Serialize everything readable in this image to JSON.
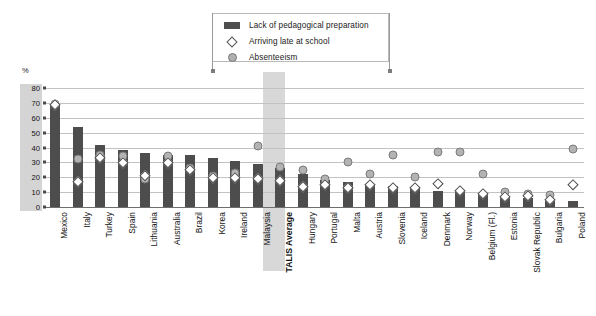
{
  "legend": {
    "items": [
      {
        "label": "Lack of pedagogical preparation",
        "mark": "bar-swatch",
        "color": "#4f4f4f"
      },
      {
        "label": "Arriving late at school",
        "mark": "diamond-marker",
        "color": "#ffffff"
      },
      {
        "label": "Absenteeism",
        "mark": "circle-marker",
        "color": "#b0b0b0"
      }
    ]
  },
  "axis": {
    "y_unit_label": "%",
    "y_ticks": [
      "0",
      "10",
      "20",
      "30",
      "40",
      "50",
      "60",
      "70",
      "80"
    ]
  },
  "chart_data": {
    "type": "bar",
    "title": "",
    "subtitle": "",
    "xlabel": "",
    "ylabel": "%",
    "ylim": [
      0,
      80
    ],
    "ytick_step": 10,
    "grid": true,
    "legend_position": "top-center",
    "highlighted_category": "TALIS Average",
    "categories": [
      "Mexico",
      "Italy",
      "Turkey",
      "Spain",
      "Lithuania",
      "Australia",
      "Brazil",
      "Korea",
      "Ireland",
      "Malaysia",
      "TALIS Average",
      "Hungary",
      "Portugal",
      "Malta",
      "Austria",
      "Slovenia",
      "Iceland",
      "Denmark",
      "Norway",
      "Belgium (Fl.)",
      "Estonia",
      "Slovak Republic",
      "Bulgaria",
      "Poland"
    ],
    "series": [
      {
        "name": "Lack of pedagogical preparation",
        "type": "bar",
        "color": "#4d4d4d",
        "values": [
          69,
          54,
          42,
          38,
          36,
          35,
          35,
          33,
          31,
          29,
          26,
          22,
          18,
          17,
          15,
          14,
          13,
          11,
          10,
          8,
          7,
          6,
          5,
          4
        ]
      },
      {
        "name": "Arriving late at school",
        "type": "diamond-marker",
        "color": "#ffffff",
        "values": [
          69,
          17,
          33,
          30,
          21,
          30,
          25,
          20,
          20,
          19,
          18,
          14,
          15,
          13,
          15,
          13,
          13,
          16,
          11,
          9,
          7,
          8,
          5,
          15
        ]
      },
      {
        "name": "Absenteeism",
        "type": "circle-marker",
        "color": "#b3b3b3",
        "values": [
          69,
          32,
          35,
          34,
          19,
          34,
          26,
          21,
          23,
          41,
          27,
          25,
          19,
          30,
          22,
          35,
          20,
          37,
          37,
          22,
          10,
          9,
          8,
          39
        ]
      }
    ]
  }
}
